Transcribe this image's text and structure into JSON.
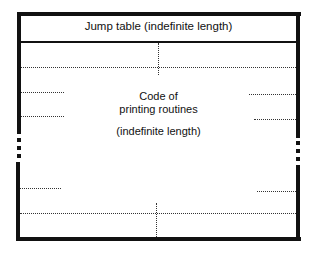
{
  "diagram": {
    "header": {
      "label": "Jump table (indefinite length)"
    },
    "body": {
      "line1": "Code of",
      "line2": "printing routines",
      "line3": "(indefinite length)"
    },
    "colors": {
      "ink": "#111111",
      "dotted": "#333333",
      "background": "#ffffff"
    }
  }
}
